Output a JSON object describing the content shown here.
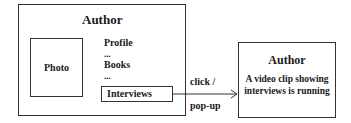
{
  "main_page": {
    "title": "Author",
    "photo_label": "Photo",
    "menu_items": [
      {
        "label": "Profile"
      },
      {
        "label": "..."
      },
      {
        "label": "Books"
      },
      {
        "label": "..."
      },
      {
        "label": "Interviews"
      }
    ]
  },
  "transition": {
    "top_label": "click /",
    "bottom_label": "pop-up",
    "icon": "arrow-right-icon"
  },
  "popup": {
    "title": "Author",
    "description": "A video clip showing interviews is running"
  }
}
